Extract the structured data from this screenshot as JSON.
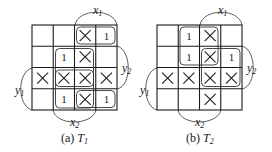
{
  "maps": [
    {
      "id": "T1",
      "caption_prefix": "(a)",
      "caption_var": "T",
      "caption_sub": "1",
      "labels": {
        "x1": "x",
        "x1_sub": "1",
        "x2": "x",
        "x2_sub": "2",
        "y1": "y",
        "y1_sub": "1",
        "y2": "y",
        "y2_sub": "2"
      },
      "cells": [
        [
          "",
          "",
          "X",
          "1"
        ],
        [
          "",
          "1",
          "X",
          ""
        ],
        [
          "X",
          "X",
          "X",
          "X"
        ],
        [
          "",
          "1",
          "X",
          "1"
        ]
      ]
    },
    {
      "id": "T2",
      "caption_prefix": "(b)",
      "caption_var": "T",
      "caption_sub": "2",
      "labels": {
        "x1": "x",
        "x1_sub": "1",
        "x2": "x",
        "x2_sub": "2",
        "y1": "y",
        "y1_sub": "1",
        "y2": "y",
        "y2_sub": "2"
      },
      "cells": [
        [
          "",
          "1",
          "X",
          ""
        ],
        [
          "",
          "1",
          "X",
          "1"
        ],
        [
          "X",
          "X",
          "X",
          "X"
        ],
        [
          "",
          "",
          "X",
          ""
        ]
      ]
    }
  ]
}
